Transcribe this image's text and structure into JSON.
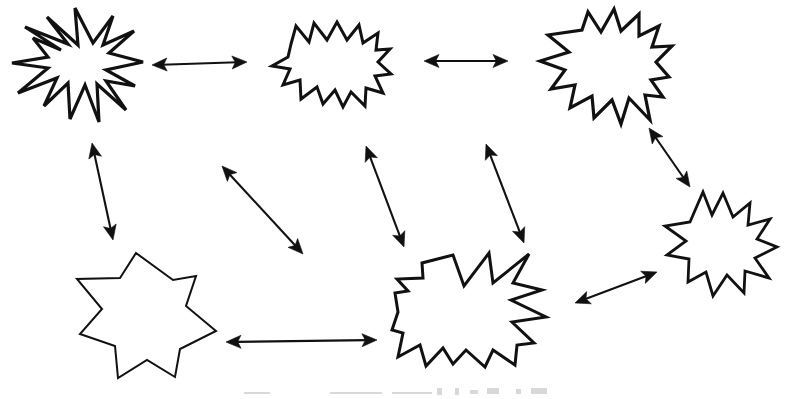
{
  "figure": {
    "background_color": "#ffffff",
    "ink_color": "#111111",
    "width": 789,
    "height": 399
  },
  "nodes": [
    {
      "id": "node-top-left",
      "label": "Top-left starburst",
      "shape": "starburst-12-point",
      "cx": 79,
      "cy": 72,
      "stroke_width": 3.2,
      "points": "33,38 61,50 25,27 68,44 47,17 78,45 75,8 93,43 113,16 103,45 134,31 109,53 143,62 106,70 135,86 106,81 126,110 97,84 99,122 85,85 70,119 68,83 44,106 57,78 18,93 48,68 12,63 48,57"
    },
    {
      "id": "node-top-middle",
      "label": "Top-middle starburst",
      "shape": "starburst-13-point",
      "cx": 328,
      "cy": 68,
      "stroke_width": 3.0,
      "points": "291,44 296,26 309,42 314,23 327,40 337,22 347,40 359,25 363,43 378,33 376,50 390,49 378,62 391,74 375,76 383,93 366,88 365,106 351,92 343,107 335,90 323,104 317,87 301,99 300,80 283,85 290,69 272,66 288,57"
    },
    {
      "id": "node-top-right",
      "label": "Top-right starburst",
      "shape": "starburst-12-point",
      "cx": 603,
      "cy": 72,
      "stroke_width": 3.2,
      "points": "582,30 588,12 601,32 614,9 621,31 639,14 639,36 659,26 652,47 672,46 656,62 669,77 651,80 663,97 645,95 650,120 629,98 621,124 612,100 594,118 592,96 570,108 575,85 551,89 565,70 540,61 569,52 548,35"
    },
    {
      "id": "node-bottom-left",
      "label": "Bottom-left seven-point star",
      "shape": "star-7-point",
      "cx": 143,
      "cy": 312,
      "stroke_width": 2.0,
      "points": "136,253 173,280 196,276 186,306 216,331 180,349 175,377 147,360 118,378 115,346 80,334 102,309 77,279 120,278"
    },
    {
      "id": "node-bottom-middle",
      "label": "Bottom-middle starburst",
      "shape": "starburst-14-point",
      "cx": 469,
      "cy": 305,
      "stroke_width": 3.0,
      "points": "453,255 464,286 489,253 493,283 529,254 513,283 542,290 511,300 546,317 512,322 534,343 517,345 515,365 493,350 485,367 466,350 453,364 443,348 426,366 420,345 398,357 403,333 392,330 398,312 395,293 408,291 397,279 423,278 422,263"
    },
    {
      "id": "node-bottom-right",
      "label": "Bottom-right starburst",
      "shape": "starburst-11-point",
      "cx": 716,
      "cy": 243,
      "stroke_width": 2.8,
      "points": "703,192 712,215 723,193 733,217 750,203 748,225 770,219 757,239 777,247 755,258 769,278 745,271 744,293 727,275 713,296 706,272 688,282 689,259 667,255 686,241 665,226 690,222"
    }
  ],
  "edges": [
    {
      "id": "edge-topleft-topmiddle",
      "label": "Top-left to top-middle",
      "from": "node-top-left",
      "to": "node-top-middle",
      "direction": "bidirectional",
      "x1": 152,
      "y1": 65,
      "x2": 247,
      "y2": 62
    },
    {
      "id": "edge-topmiddle-topright",
      "label": "Top-middle to top-right",
      "from": "node-top-middle",
      "to": "node-top-right",
      "direction": "bidirectional",
      "x1": 424,
      "y1": 61,
      "x2": 508,
      "y2": 61
    },
    {
      "id": "edge-topleft-bottomleft",
      "label": "Top-left to bottom-left star",
      "from": "node-top-left",
      "to": "node-bottom-left",
      "direction": "bidirectional",
      "x1": 92,
      "y1": 143,
      "x2": 113,
      "y2": 240
    },
    {
      "id": "edge-topmiddle-bottommiddle",
      "label": "Top-middle to bottom-middle",
      "from": "node-top-middle",
      "to": "node-bottom-middle",
      "direction": "bidirectional",
      "x1": 366,
      "y1": 146,
      "x2": 404,
      "y2": 247
    },
    {
      "id": "edge-crossing-diagonal",
      "label": "Diagonal crossing link",
      "from": "node-top-middle",
      "to": "node-bottom-left",
      "direction": "bidirectional",
      "x1": 222,
      "y1": 166,
      "x2": 303,
      "y2": 254
    },
    {
      "id": "edge-topright-bottommiddle",
      "label": "Top-right to bottom-middle",
      "from": "node-top-right",
      "to": "node-bottom-middle",
      "direction": "bidirectional",
      "x1": 486,
      "y1": 144,
      "x2": 524,
      "y2": 243
    },
    {
      "id": "edge-topright-bottomright",
      "label": "Top-right to bottom-right",
      "from": "node-top-right",
      "to": "node-bottom-right",
      "direction": "bidirectional",
      "x1": 649,
      "y1": 128,
      "x2": 690,
      "y2": 187
    },
    {
      "id": "edge-bottommiddle-bottomright",
      "label": "Bottom-middle to bottom-right",
      "from": "node-bottom-middle",
      "to": "node-bottom-right",
      "direction": "bidirectional",
      "x1": 575,
      "y1": 303,
      "x2": 657,
      "y2": 272
    },
    {
      "id": "edge-bottomleft-bottommiddle",
      "label": "Bottom-left star to bottom-middle",
      "from": "node-bottom-left",
      "to": "node-bottom-middle",
      "direction": "bidirectional",
      "x1": 226,
      "y1": 342,
      "x2": 377,
      "y2": 340
    }
  ],
  "arrowhead": {
    "length": 15,
    "half_width": 6.5
  },
  "artifacts": [
    {
      "id": "smudge-1",
      "x": 244,
      "y": 392,
      "width": 26,
      "height": 2
    },
    {
      "id": "smudge-2",
      "x": 330,
      "y": 392,
      "width": 52,
      "height": 2
    },
    {
      "id": "smudge-3",
      "x": 392,
      "y": 392,
      "width": 40,
      "height": 2
    },
    {
      "id": "smudge-4",
      "x": 437,
      "y": 388,
      "width": 5,
      "height": 7
    },
    {
      "id": "smudge-5",
      "x": 455,
      "y": 388,
      "width": 4,
      "height": 7
    },
    {
      "id": "smudge-6",
      "x": 470,
      "y": 390,
      "width": 8,
      "height": 4
    },
    {
      "id": "smudge-7",
      "x": 487,
      "y": 388,
      "width": 12,
      "height": 6
    },
    {
      "id": "smudge-8",
      "x": 516,
      "y": 389,
      "width": 5,
      "height": 5
    },
    {
      "id": "smudge-9",
      "x": 531,
      "y": 388,
      "width": 16,
      "height": 6
    }
  ]
}
